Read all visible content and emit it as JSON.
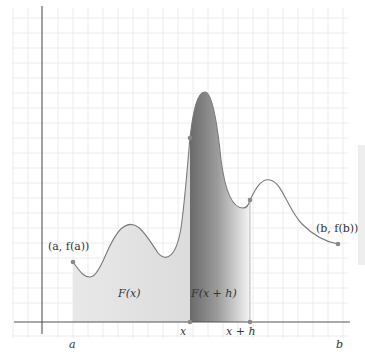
{
  "diagram": {
    "title": "",
    "type": "area-under-curve",
    "colors": {
      "grid": "#ececec",
      "axis": "#555555",
      "curve": "#777777",
      "fill_F_x": "#e4e4e4",
      "fill_strip_dark": "#6e6e6e",
      "fill_strip_light": "#f2f2f2",
      "point": "#888888"
    },
    "labels": {
      "point_a": "(a, f(a))",
      "point_b": "(b, f(b))",
      "area_F_x": "F(x)",
      "area_F_x_h": "F(x + h)",
      "tick_a": "a",
      "tick_x": "x",
      "tick_x_h": "x + h",
      "tick_b": "b"
    },
    "points": [
      {
        "name": "a-f(a)",
        "x": 73,
        "y": 262
      },
      {
        "name": "x-f(x)",
        "x": 190,
        "y": 138
      },
      {
        "name": "x+h-f(x+h)",
        "x": 250,
        "y": 200
      },
      {
        "name": "b-f(b)",
        "x": 338,
        "y": 244
      },
      {
        "name": "x-axis-x",
        "x": 190,
        "y": 322
      },
      {
        "name": "x-axis-x+h",
        "x": 250,
        "y": 322
      }
    ]
  }
}
